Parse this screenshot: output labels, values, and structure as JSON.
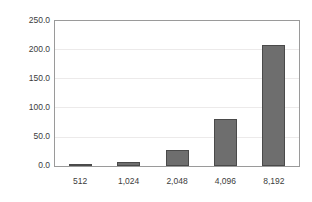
{
  "chart_data": {
    "type": "bar",
    "title": "",
    "subtitle": "",
    "xlabel": "",
    "ylabel": "",
    "categories": [
      "512",
      "1,024",
      "2,048",
      "4,096",
      "8,192"
    ],
    "values": [
      2.5,
      6.5,
      27.0,
      80.0,
      206.0
    ],
    "series": [
      {
        "name": "",
        "values": [
          2.5,
          6.5,
          27.0,
          80.0,
          206.0
        ]
      }
    ],
    "ylim": [
      0.0,
      250.0
    ],
    "ytick_values": [
      0.0,
      50.0,
      100.0,
      150.0,
      200.0,
      250.0
    ],
    "ytick_labels": [
      "0.0",
      "50.0",
      "100.0",
      "150.0",
      "200.0",
      "250.0"
    ],
    "xtick_labels": [
      "512",
      "1,024",
      "2,048",
      "4,096",
      "8,192"
    ],
    "grid": "horizontal",
    "legend": "none",
    "annotations": [],
    "colors": {
      "bar_fill": "#6e6e6e",
      "bar_stroke": "#4a4a4a",
      "gridline": "#eceaea",
      "frame": "#9a9a9a",
      "background": "#ffffff",
      "text": "#3c3c3c"
    }
  }
}
